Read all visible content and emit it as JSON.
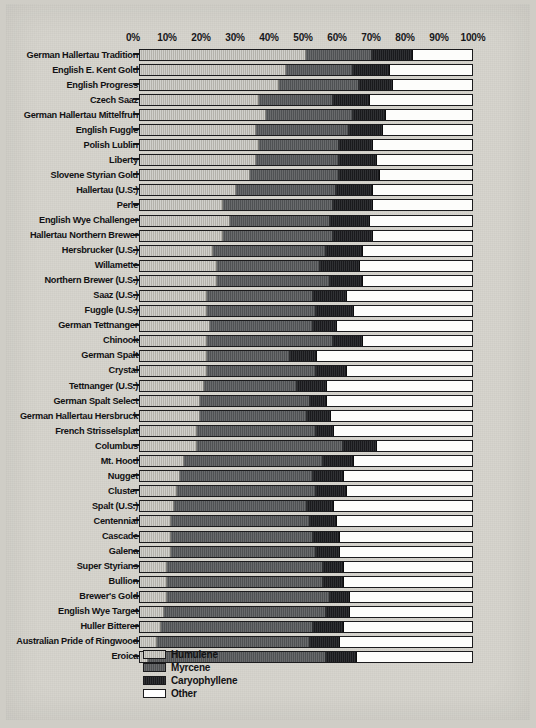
{
  "chart_data": {
    "type": "bar",
    "subtype": "stacked-horizontal-100pct",
    "title": "",
    "xlabel": "",
    "ylabel": "",
    "xlim": [
      0,
      100
    ],
    "grid": false,
    "legend_position": "bottom-center",
    "axis_ticks": [
      "0%",
      "10%",
      "20%",
      "30%",
      "40%",
      "50%",
      "60%",
      "70%",
      "80%",
      "90%",
      "100%"
    ],
    "series": [
      {
        "name": "Humulene",
        "color": "#b9b7b0"
      },
      {
        "name": "Myrcene",
        "color": "#585a5c"
      },
      {
        "name": "Caryophyllene",
        "color": "#1c1d20"
      },
      {
        "name": "Other",
        "color": "#ffffff"
      }
    ],
    "categories": [
      "German Hallertau Tradition",
      "English E. Kent Gold",
      "English Progress",
      "Czech Saaz",
      "German Hallertau  Mittelfruh",
      "English Fuggle",
      "Polish Lublin",
      "Liberty",
      "Slovene Styrian Gold",
      "Hallertau (U.S.)",
      "Perle",
      "English Wye Challenger",
      "Hallertau Northern Brewer",
      "Hersbrucker (U.S.)",
      "Willamette",
      "Northern Brewer (U.S.)",
      "Saaz (U.S.)",
      "Fuggle (U.S.)",
      "German Tettnanger",
      "Chinook",
      "German Spalt",
      "Crystal",
      "Tettnanger (U.S.)",
      "German Spalt Select",
      "German Hallertau Hersbruck",
      "French Strisselsplat",
      "Columbus",
      "Mt. Hood",
      "Nugget",
      "Cluster",
      "Spalt (U.S.)",
      "Centennial",
      "Cascade",
      "Galena",
      "Super Styrians",
      "Bullion",
      "Brewer's Gold",
      "English Wye Target",
      "Huller Bitterer",
      "Australian Pride of Ringwood",
      "Eroica"
    ],
    "values": [
      [
        50,
        20,
        12,
        18
      ],
      [
        44,
        20,
        11,
        25
      ],
      [
        42,
        24,
        10,
        24
      ],
      [
        36,
        22,
        11,
        31
      ],
      [
        38,
        26,
        10,
        26
      ],
      [
        35,
        28,
        10,
        27
      ],
      [
        36,
        24,
        10,
        30
      ],
      [
        35,
        25,
        11,
        29
      ],
      [
        33,
        27,
        12,
        28
      ],
      [
        29,
        30,
        11,
        30
      ],
      [
        25,
        33,
        12,
        30
      ],
      [
        27,
        30,
        12,
        31
      ],
      [
        25,
        33,
        12,
        30
      ],
      [
        22,
        34,
        11,
        33
      ],
      [
        23,
        31,
        12,
        34
      ],
      [
        23,
        34,
        10,
        33
      ],
      [
        20,
        32,
        10,
        38
      ],
      [
        20,
        33,
        11,
        36
      ],
      [
        21,
        31,
        7,
        41
      ],
      [
        20,
        38,
        9,
        33
      ],
      [
        20,
        25,
        8,
        47
      ],
      [
        20,
        33,
        9,
        38
      ],
      [
        19,
        28,
        9,
        44
      ],
      [
        18,
        33,
        5,
        44
      ],
      [
        18,
        32,
        7,
        43
      ],
      [
        17,
        36,
        5,
        42
      ],
      [
        17,
        44,
        10,
        29
      ],
      [
        13,
        42,
        9,
        36
      ],
      [
        12,
        40,
        9,
        39
      ],
      [
        11,
        42,
        9,
        38
      ],
      [
        10,
        40,
        8,
        42
      ],
      [
        9,
        42,
        8,
        41
      ],
      [
        9,
        43,
        8,
        40
      ],
      [
        9,
        44,
        7,
        40
      ],
      [
        8,
        47,
        6,
        39
      ],
      [
        8,
        47,
        6,
        39
      ],
      [
        8,
        49,
        6,
        37
      ],
      [
        7,
        49,
        7,
        37
      ],
      [
        6,
        46,
        9,
        39
      ],
      [
        5,
        46,
        9,
        40
      ],
      [
        2,
        54,
        9,
        35
      ]
    ]
  },
  "legend": {
    "items": [
      {
        "label": "Humulene",
        "color": "#b9b7b0"
      },
      {
        "label": "Myrcene",
        "color": "#585a5c"
      },
      {
        "label": "Caryophyllene",
        "color": "#1c1d20"
      },
      {
        "label": "Other",
        "color": "#ffffff"
      }
    ]
  }
}
